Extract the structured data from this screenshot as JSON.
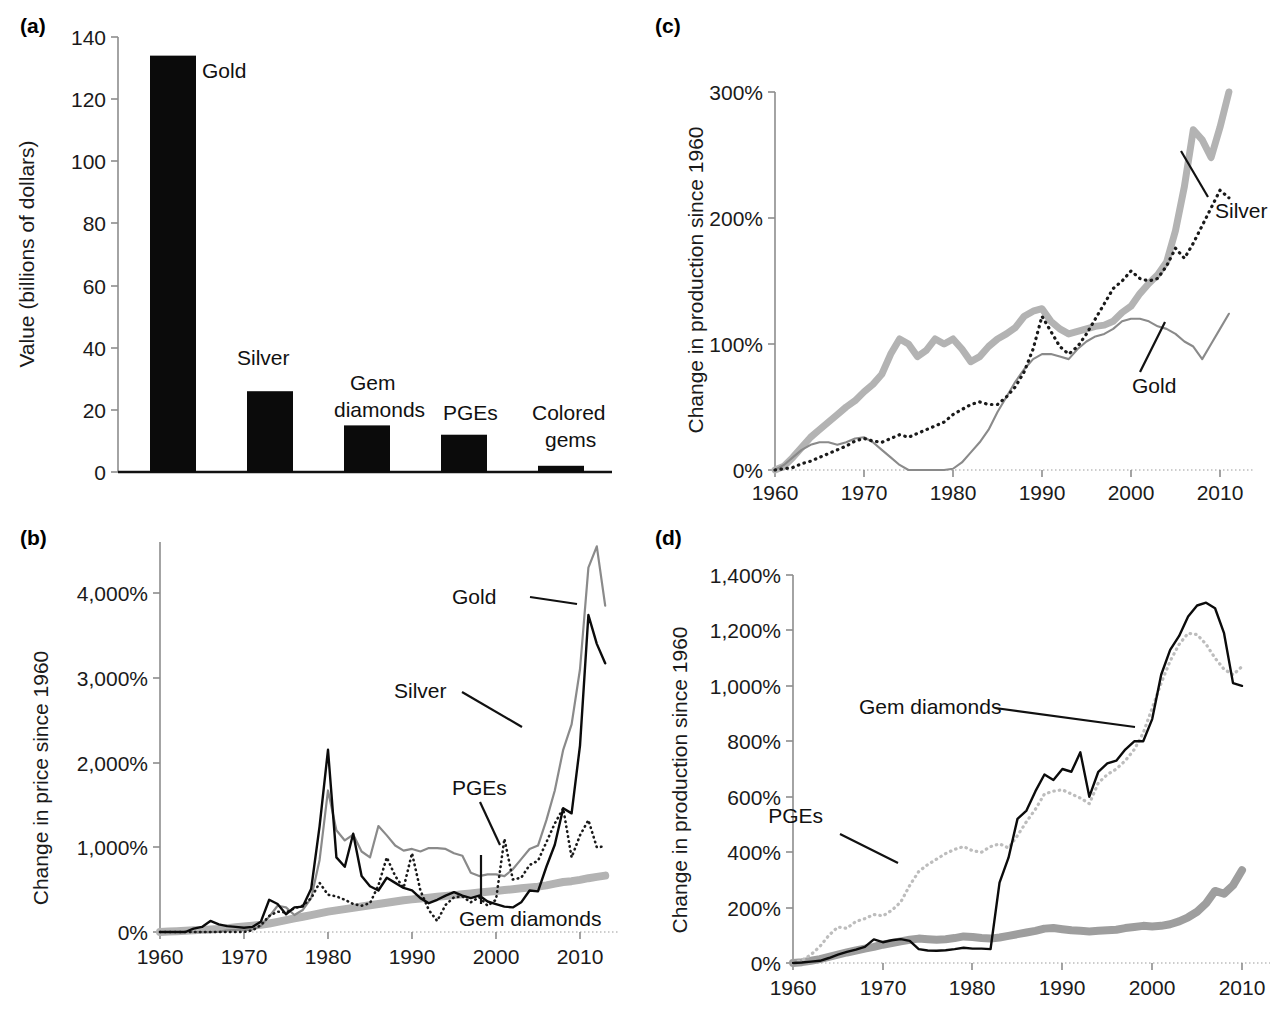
{
  "figure": {
    "panels": [
      "(a)",
      "(b)",
      "(c)",
      "(d)"
    ]
  },
  "panel_a": {
    "tag": "(a)",
    "ylabel": "Value (billions of dollars)",
    "yticks": [
      "0",
      "20",
      "40",
      "60",
      "80",
      "100",
      "120",
      "140"
    ],
    "bar_labels": [
      "Gold",
      "Silver",
      "Gem",
      "diamonds",
      "PGEs",
      "Colored",
      "gems"
    ]
  },
  "panel_b": {
    "tag": "(b)",
    "ylabel": "Change in price since 1960",
    "yticks": [
      "0%",
      "1,000%",
      "2,000%",
      "3,000%",
      "4,000%"
    ],
    "xticks": [
      "1960",
      "1970",
      "1980",
      "1990",
      "2000",
      "2010"
    ],
    "series_labels": [
      "Gold",
      "Silver",
      "PGEs",
      "Gem diamonds"
    ]
  },
  "panel_c": {
    "tag": "(c)",
    "ylabel": "Change in production since 1960",
    "yticks": [
      "0%",
      "100%",
      "200%",
      "300%"
    ],
    "xticks": [
      "1960",
      "1970",
      "1980",
      "1990",
      "2000",
      "2010"
    ],
    "series_labels": [
      "Silver",
      "Gold"
    ]
  },
  "panel_d": {
    "tag": "(d)",
    "ylabel": "Change in production since 1960",
    "yticks": [
      "0%",
      "200%",
      "400%",
      "600%",
      "800%",
      "1,000%",
      "1,200%",
      "1,400%"
    ],
    "xticks": [
      "1960",
      "1970",
      "1980",
      "1990",
      "2000",
      "2010"
    ],
    "series_labels": [
      "Gem diamonds",
      "PGEs"
    ]
  },
  "colors": {
    "black": "#0b0b0b",
    "thick_gray": "#b3b3b3",
    "mid_gray": "#8a8a8a",
    "dotted_gray": "#bdbdbd",
    "axis_gray": "#8d8d8d"
  },
  "chart_data": [
    {
      "panel": "(a)",
      "type": "bar",
      "title": "",
      "xlabel": "",
      "ylabel": "Value (billions of dollars)",
      "ylim": [
        0,
        140
      ],
      "ytick_values": [
        0,
        20,
        40,
        60,
        80,
        100,
        120,
        140
      ],
      "grid": false,
      "legend": "none",
      "categories": [
        "Gold",
        "Silver",
        "Gem diamonds",
        "PGEs",
        "Colored gems"
      ],
      "values": [
        134,
        26,
        15,
        12,
        2
      ]
    },
    {
      "panel": "(b)",
      "type": "line",
      "title": "",
      "xlabel": "",
      "ylabel": "Change in price since 1960",
      "xlim": [
        1960,
        2013
      ],
      "ylim": [
        0,
        4600
      ],
      "ytick_values": [
        0,
        1000,
        2000,
        3000,
        4000
      ],
      "xtick_values": [
        1960,
        1970,
        1980,
        1990,
        2000,
        2010
      ],
      "grid": false,
      "legend": "inline annotations",
      "x": [
        1960,
        1961,
        1962,
        1963,
        1964,
        1965,
        1966,
        1967,
        1968,
        1969,
        1970,
        1971,
        1972,
        1973,
        1974,
        1975,
        1976,
        1977,
        1978,
        1979,
        1980,
        1981,
        1982,
        1983,
        1984,
        1985,
        1986,
        1987,
        1988,
        1989,
        1990,
        1991,
        1992,
        1993,
        1994,
        1995,
        1996,
        1997,
        1998,
        1999,
        2000,
        2001,
        2002,
        2003,
        2004,
        2005,
        2006,
        2007,
        2008,
        2009,
        2010,
        2011,
        2012,
        2013
      ],
      "series": [
        {
          "name": "Gold",
          "style": "thin-gray-solid",
          "values": [
            0,
            0,
            0,
            0,
            0,
            0,
            0,
            5,
            20,
            25,
            20,
            30,
            70,
            180,
            310,
            290,
            200,
            260,
            400,
            850,
            1670,
            1200,
            1080,
            1150,
            950,
            880,
            1250,
            1140,
            1020,
            960,
            980,
            950,
            990,
            990,
            980,
            930,
            900,
            700,
            660,
            680,
            680,
            660,
            740,
            860,
            980,
            1020,
            1320,
            1670,
            2150,
            2450,
            3100,
            4300,
            4550,
            3850
          ]
        },
        {
          "name": "Silver",
          "style": "thin-black-solid",
          "values": [
            0,
            0,
            0,
            0,
            40,
            60,
            130,
            90,
            70,
            60,
            50,
            60,
            120,
            380,
            330,
            210,
            290,
            300,
            510,
            1250,
            2150,
            880,
            770,
            1160,
            660,
            540,
            490,
            640,
            580,
            520,
            490,
            400,
            340,
            380,
            430,
            470,
            430,
            400,
            430,
            360,
            330,
            300,
            290,
            350,
            490,
            480,
            770,
            1030,
            1460,
            1400,
            2200,
            3740,
            3400,
            3170
          ]
        },
        {
          "name": "PGEs",
          "style": "dotted-black",
          "values": [
            0,
            0,
            0,
            0,
            0,
            0,
            0,
            0,
            0,
            0,
            0,
            20,
            80,
            190,
            240,
            230,
            280,
            310,
            400,
            580,
            440,
            420,
            380,
            330,
            310,
            340,
            550,
            880,
            660,
            520,
            930,
            490,
            260,
            130,
            320,
            410,
            420,
            350,
            410,
            310,
            380,
            1100,
            620,
            640,
            790,
            840,
            1060,
            1280,
            1460,
            880,
            1140,
            1320,
            1000,
            1010
          ]
        },
        {
          "name": "Gem diamonds",
          "style": "thick-gray",
          "values": [
            0,
            5,
            10,
            15,
            20,
            25,
            30,
            35,
            45,
            55,
            65,
            75,
            85,
            100,
            120,
            140,
            160,
            180,
            200,
            220,
            240,
            255,
            270,
            285,
            300,
            315,
            330,
            345,
            360,
            375,
            385,
            395,
            405,
            415,
            425,
            435,
            445,
            455,
            465,
            475,
            485,
            495,
            505,
            515,
            525,
            535,
            550,
            570,
            590,
            600,
            615,
            635,
            650,
            665
          ]
        }
      ]
    },
    {
      "panel": "(c)",
      "type": "line",
      "title": "",
      "xlabel": "",
      "ylabel": "Change in production since 1960",
      "xlim": [
        1960,
        2011
      ],
      "ylim": [
        0,
        300
      ],
      "ytick_values": [
        0,
        100,
        200,
        300
      ],
      "xtick_values": [
        1960,
        1970,
        1980,
        1990,
        2000,
        2010
      ],
      "grid": false,
      "legend": "inline annotations",
      "x": [
        1960,
        1961,
        1962,
        1963,
        1964,
        1965,
        1966,
        1967,
        1968,
        1969,
        1970,
        1971,
        1972,
        1973,
        1974,
        1975,
        1976,
        1977,
        1978,
        1979,
        1980,
        1981,
        1982,
        1983,
        1984,
        1985,
        1986,
        1987,
        1988,
        1989,
        1990,
        1991,
        1992,
        1993,
        1994,
        1995,
        1996,
        1997,
        1998,
        1999,
        2000,
        2001,
        2002,
        2003,
        2004,
        2005,
        2006,
        2007,
        2008,
        2009,
        2010,
        2011
      ],
      "series": [
        {
          "name": "PGEs",
          "style": "thick-gray",
          "values": [
            0,
            3,
            10,
            18,
            26,
            32,
            38,
            44,
            50,
            55,
            62,
            68,
            76,
            92,
            104,
            100,
            90,
            95,
            104,
            100,
            104,
            96,
            86,
            90,
            98,
            104,
            108,
            113,
            122,
            126,
            128,
            118,
            112,
            108,
            110,
            112,
            114,
            115,
            118,
            125,
            130,
            140,
            148,
            155,
            165,
            190,
            225,
            270,
            262,
            248,
            272,
            300
          ]
        },
        {
          "name": "Silver",
          "style": "dotted-black",
          "values": [
            0,
            1,
            2,
            5,
            7,
            10,
            13,
            16,
            19,
            23,
            25,
            23,
            22,
            25,
            28,
            26,
            29,
            32,
            35,
            38,
            44,
            48,
            52,
            54,
            52,
            52,
            58,
            66,
            78,
            96,
            122,
            110,
            98,
            92,
            98,
            108,
            120,
            132,
            144,
            150,
            158,
            152,
            150,
            152,
            162,
            176,
            168,
            180,
            194,
            208,
            222,
            216
          ]
        },
        {
          "name": "Gold",
          "style": "thin-gray-solid",
          "values": [
            0,
            4,
            10,
            16,
            20,
            22,
            22,
            20,
            22,
            25,
            26,
            22,
            16,
            10,
            4,
            0,
            0,
            0,
            0,
            0,
            1,
            6,
            14,
            22,
            32,
            46,
            58,
            70,
            80,
            88,
            92,
            92,
            90,
            88,
            96,
            102,
            106,
            108,
            112,
            118,
            120,
            120,
            118,
            114,
            112,
            108,
            102,
            98,
            88,
            100,
            112,
            124
          ]
        }
      ]
    },
    {
      "panel": "(d)",
      "type": "line",
      "title": "",
      "xlabel": "",
      "ylabel": "Change in production since 1960",
      "xlim": [
        1960,
        2011
      ],
      "ylim": [
        0,
        1400
      ],
      "ytick_values": [
        0,
        200,
        400,
        600,
        800,
        1000,
        1200,
        1400
      ],
      "xtick_values": [
        1960,
        1970,
        1980,
        1990,
        2000,
        2010
      ],
      "grid": false,
      "legend": "inline annotations",
      "x": [
        1960,
        1961,
        1962,
        1963,
        1964,
        1965,
        1966,
        1967,
        1968,
        1969,
        1970,
        1971,
        1972,
        1973,
        1974,
        1975,
        1976,
        1977,
        1978,
        1979,
        1980,
        1981,
        1982,
        1983,
        1984,
        1985,
        1986,
        1987,
        1988,
        1989,
        1990,
        1991,
        1992,
        1993,
        1994,
        1995,
        1996,
        1997,
        1998,
        1999,
        2000,
        2001,
        2002,
        2003,
        2004,
        2005,
        2006,
        2007,
        2008,
        2009,
        2010
      ],
      "series": [
        {
          "name": "Gem diamonds",
          "style": "thin-black-solid",
          "values": [
            0,
            2,
            5,
            8,
            18,
            30,
            40,
            48,
            58,
            85,
            75,
            82,
            86,
            80,
            50,
            45,
            44,
            46,
            50,
            55,
            52,
            52,
            50,
            290,
            380,
            520,
            550,
            620,
            680,
            660,
            700,
            690,
            760,
            600,
            690,
            720,
            730,
            770,
            800,
            800,
            880,
            1040,
            1130,
            1180,
            1250,
            1290,
            1300,
            1280,
            1190,
            1010,
            1000
          ]
        },
        {
          "name": "PGEs",
          "style": "dotted-gray",
          "values": [
            0,
            10,
            30,
            60,
            100,
            130,
            125,
            150,
            160,
            175,
            170,
            190,
            220,
            280,
            330,
            355,
            375,
            395,
            410,
            420,
            405,
            400,
            420,
            430,
            415,
            460,
            510,
            555,
            610,
            620,
            625,
            610,
            595,
            575,
            650,
            680,
            700,
            730,
            770,
            830,
            920,
            1010,
            1090,
            1150,
            1190,
            1185,
            1150,
            1100,
            1060,
            1040,
            1070
          ]
        },
        {
          "name": "Silver",
          "style": "thick-gray",
          "values": [
            0,
            3,
            8,
            14,
            22,
            30,
            38,
            45,
            52,
            58,
            66,
            72,
            78,
            84,
            88,
            86,
            84,
            86,
            90,
            96,
            94,
            90,
            88,
            92,
            98,
            104,
            110,
            116,
            124,
            126,
            122,
            118,
            116,
            114,
            116,
            118,
            120,
            126,
            130,
            134,
            132,
            134,
            140,
            150,
            165,
            185,
            215,
            260,
            250,
            280,
            335
          ]
        }
      ]
    }
  ]
}
